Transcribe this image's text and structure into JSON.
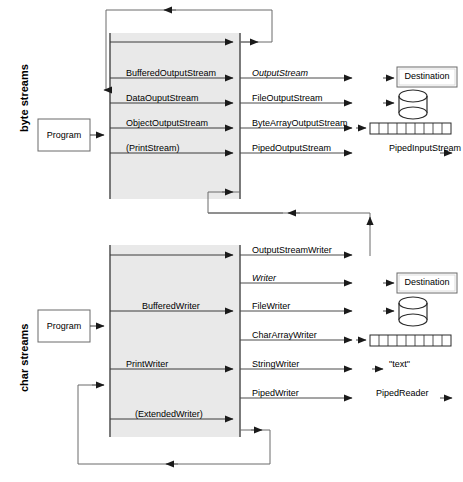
{
  "diagram": {
    "colors": {
      "line": "#3a3a3a",
      "box_fill_gray": "#e8e8e8",
      "box_border": "#555555",
      "text": "#000000",
      "background": "#ffffff"
    },
    "sections": [
      {
        "id": "byte-streams",
        "title": "byte streams",
        "source_box_label": "Program",
        "filters": [
          "BufferedOutputStream",
          "DataOuputStream",
          "ObjectOutputStream",
          "(PrintStream)"
        ],
        "sinks": [
          {
            "label": "OutputStream",
            "italic": true,
            "target": "Destination",
            "target_type": "box"
          },
          {
            "label": "FileOutputStream",
            "italic": false,
            "target": "",
            "target_type": "cylinder"
          },
          {
            "label": "ByteArrayOutputStream",
            "italic": false,
            "target": "",
            "target_type": "array"
          },
          {
            "label": "PipedOutputStream",
            "italic": false,
            "target": "PipedInputStream",
            "target_type": "text"
          }
        ]
      },
      {
        "id": "char-streams",
        "title": "char streams",
        "source_box_label": "Program",
        "filters": [
          "BufferedWriter",
          "PrintWriter",
          "(ExtendedWriter)"
        ],
        "sinks": [
          {
            "label": "OutputStreamWriter",
            "italic": false,
            "target": "",
            "target_type": "feedback-up"
          },
          {
            "label": "Writer",
            "italic": true,
            "target": "Destination",
            "target_type": "box"
          },
          {
            "label": "FileWriter",
            "italic": false,
            "target": "",
            "target_type": "cylinder"
          },
          {
            "label": "CharArrayWriter",
            "italic": false,
            "target": "",
            "target_type": "array"
          },
          {
            "label": "StringWriter",
            "italic": false,
            "target": "\"text\"",
            "target_type": "text"
          },
          {
            "label": "PipedWriter",
            "italic": false,
            "target": "PipedReader",
            "target_type": "text"
          }
        ]
      }
    ],
    "targets": {
      "destination_label": "Destination",
      "text_literal": "\"text\"",
      "piped_input_stream": "PipedInputStream",
      "piped_reader": "PipedReader",
      "array_cells": 9
    }
  }
}
